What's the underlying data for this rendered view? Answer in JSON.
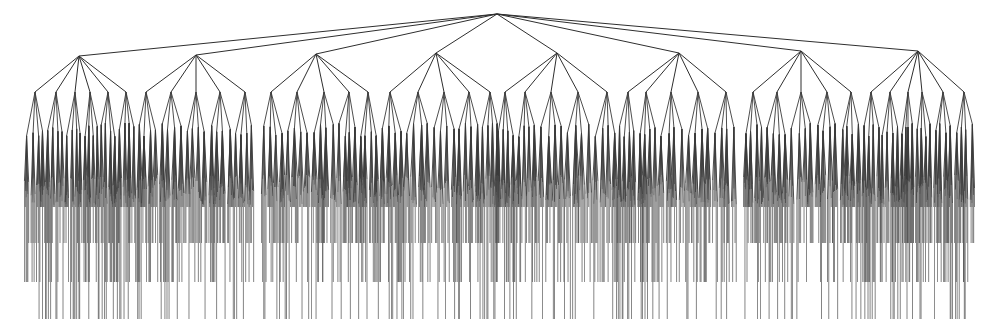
{
  "diagram": {
    "type": "tree",
    "background": "#ffffff",
    "edge_color": "#3a3a3a",
    "root": {
      "x": 497,
      "y": 14
    },
    "level1_y": 54,
    "level2_y": 92,
    "level3_y": 130,
    "leaf_depths": [
      207,
      243,
      282,
      319
    ],
    "groups": [
      {
        "x": 79,
        "y": 56,
        "children": [
          35,
          56,
          75,
          90,
          108,
          126
        ]
      },
      {
        "x": 196,
        "y": 55,
        "children": [
          146,
          171,
          196,
          220,
          245
        ]
      },
      {
        "x": 316,
        "y": 54,
        "children": [
          271,
          297,
          324,
          349,
          368
        ]
      },
      {
        "x": 436,
        "y": 53,
        "children": [
          390,
          418,
          444,
          469,
          490
        ]
      },
      {
        "x": 557,
        "y": 53,
        "children": [
          505,
          525,
          551,
          578,
          607
        ]
      },
      {
        "x": 679,
        "y": 53,
        "children": [
          628,
          646,
          671,
          698,
          726
        ]
      },
      {
        "x": 801,
        "y": 51,
        "children": [
          753,
          777,
          801,
          827,
          851
        ]
      },
      {
        "x": 918,
        "y": 51,
        "children": [
          871,
          890,
          908,
          922,
          943,
          964
        ]
      }
    ]
  }
}
